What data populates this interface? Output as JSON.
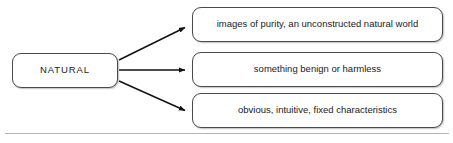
{
  "diagram": {
    "type": "concept-map",
    "title_node": {
      "id": "natural",
      "label": "NATURAL"
    },
    "branches": [
      {
        "id": "branch-purity",
        "label": "images of purity, an unconstructed natural world"
      },
      {
        "id": "branch-benign",
        "label": "something benign or harmless"
      },
      {
        "id": "branch-characteristics",
        "label": "obvious, intuitive, fixed characteristics"
      }
    ],
    "connectors": [
      {
        "from": "natural",
        "to": "branch-purity",
        "style": "arrow",
        "direction": "up-right"
      },
      {
        "from": "natural",
        "to": "branch-benign",
        "style": "arrow",
        "direction": "right"
      },
      {
        "from": "natural",
        "to": "branch-characteristics",
        "style": "arrow",
        "direction": "down-right"
      }
    ],
    "colors": {
      "background": "#ffffff",
      "node_fill": "#ffffff",
      "node_border": "#4a4a4a",
      "text": "#1a1a1a",
      "connector": "#111111",
      "rule": "#b4b4b4"
    }
  }
}
